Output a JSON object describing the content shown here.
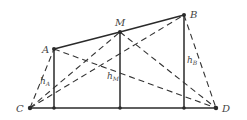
{
  "diagram": {
    "points": {
      "A": {
        "label": "A",
        "x": 54,
        "y": 49
      },
      "M": {
        "label": "M",
        "x": 120,
        "y": 32
      },
      "B": {
        "label": "B",
        "x": 184,
        "y": 15
      },
      "C": {
        "label": "C",
        "x": 30,
        "y": 108
      },
      "D": {
        "label": "D",
        "x": 216,
        "y": 108
      }
    },
    "heights": {
      "hA": {
        "main": "h",
        "sub": "A"
      },
      "hM": {
        "main": "h",
        "sub": "M"
      },
      "hB": {
        "main": "h",
        "sub": "B"
      }
    },
    "solid_segments": [
      "C-D",
      "A-M",
      "M-B",
      "A-foot",
      "M-foot",
      "B-foot"
    ],
    "dashed_segments": [
      "C-A",
      "C-M",
      "C-B",
      "A-D",
      "M-D",
      "B-D"
    ],
    "colors": {
      "line": "#2a2a2a",
      "text": "#444444",
      "background": "#ffffff"
    }
  }
}
